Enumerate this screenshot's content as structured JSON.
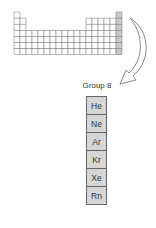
{
  "diagram": {
    "periodic_table": {
      "columns": 18,
      "rows": 7,
      "highlighted_column": 18,
      "highlight_color": "#c8c8c8",
      "grid_color": "#777777"
    },
    "arrow": {
      "from": "column-18",
      "to": "group-label"
    },
    "group_label": "Group 8",
    "elements": [
      "He",
      "Ne",
      "Ar",
      "Kr",
      "Xe",
      "Rn"
    ]
  }
}
